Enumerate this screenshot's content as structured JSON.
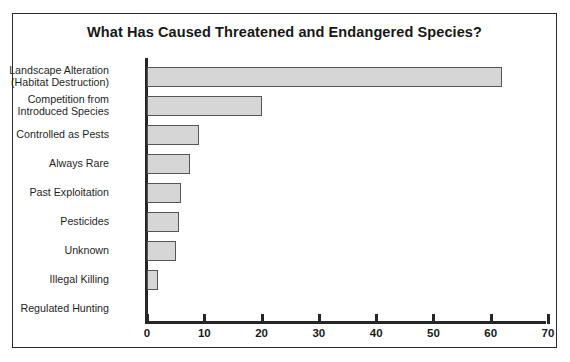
{
  "chart_data": {
    "type": "bar",
    "orientation": "horizontal",
    "title": "What Has Caused Threatened and Endangered Species?",
    "xlabel": "",
    "ylabel": "",
    "xlim": [
      0,
      70
    ],
    "xticks": [
      0,
      10,
      20,
      30,
      40,
      50,
      60,
      70
    ],
    "grid": false,
    "legend": null,
    "categories": [
      "Landscape Alteration\n(Habitat Destruction)",
      "Competition from\nIntroduced Species",
      "Controlled as Pests",
      "Always Rare",
      "Past Exploitation",
      "Pesticides",
      "Unknown",
      "Illegal Killing",
      "Regulated Hunting"
    ],
    "values": [
      62,
      20,
      9,
      7.5,
      6,
      5.5,
      5,
      2,
      0
    ],
    "colors": {
      "bar_fill": "#d6d6d6",
      "bar_border": "#565656",
      "axis": "#262626",
      "frame": "#2b2b2b",
      "text": "#1a1a1a",
      "background": "#ffffff"
    }
  }
}
